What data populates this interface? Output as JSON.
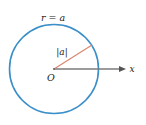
{
  "figure": {
    "title_label": "r = a",
    "radius_label": "|a|",
    "origin_label": "O",
    "axis_label": "x",
    "colors": {
      "circle": "#3b8fc9",
      "radius_line": "#d8846c",
      "axis": "#7a7a7a",
      "text": "#222222",
      "background": "#ffffff"
    },
    "geometry": {
      "center": [
        54,
        69
      ],
      "radius": 45,
      "radius_endpoint": [
        92,
        45
      ],
      "axis_end": [
        126,
        69
      ]
    }
  }
}
